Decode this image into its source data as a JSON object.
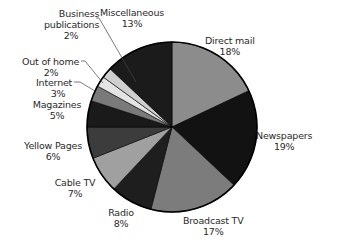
{
  "chart_data": {
    "type": "pie",
    "title": "",
    "start_angle": "12 o'clock",
    "direction": "clockwise",
    "categories": [
      "Direct mail",
      "Newspapers",
      "Broadcast TV",
      "Radio",
      "Cable TV",
      "Yellow Pages",
      "Magazines",
      "Internet",
      "Out of home",
      "Business publications",
      "Miscellaneous"
    ],
    "values": [
      18,
      19,
      17,
      8,
      7,
      6,
      5,
      3,
      2,
      2,
      13
    ],
    "unit": "%",
    "colors": [
      "#8c8c8c",
      "#121212",
      "#7c7c7c",
      "#1e1e1e",
      "#a0a0a0",
      "#3c3c3c",
      "#1a1a1a",
      "#7a7a7a",
      "#e4e4e4",
      "#cfcfcf",
      "#1b1b1b"
    ],
    "legend": "none (direct labels)"
  },
  "labels": {
    "direct_mail": {
      "name": "Direct mail",
      "pct": "18%"
    },
    "newspapers": {
      "name": "Newspapers",
      "pct": "19%"
    },
    "broadcast_tv": {
      "name": "Broadcast TV",
      "pct": "17%"
    },
    "radio": {
      "name": "Radio",
      "pct": "8%"
    },
    "cable_tv": {
      "name": "Cable TV",
      "pct": "7%"
    },
    "yellow_pages": {
      "name": "Yellow Pages",
      "pct": "6%"
    },
    "magazines": {
      "name": "Magazines",
      "pct": "5%"
    },
    "internet": {
      "name": "Internet",
      "pct": "3%"
    },
    "out_of_home": {
      "name": "Out of home",
      "pct": "2%"
    },
    "business_publications": {
      "name1": "Business",
      "name2": "publications",
      "pct": "2%"
    },
    "miscellaneous": {
      "name": "Miscellaneous",
      "pct": "13%"
    }
  }
}
